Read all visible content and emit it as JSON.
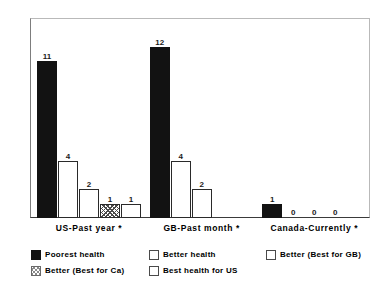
{
  "chart_data": {
    "type": "bar",
    "title": "",
    "subtitle": "",
    "xlabel": "",
    "ylabel": "",
    "ylim": [
      0,
      14
    ],
    "ytick_values": [
      0,
      2,
      4,
      6,
      8,
      10,
      12,
      14
    ],
    "ytick_labels": [
      "0",
      "2",
      "4",
      "6",
      "8",
      "10",
      "12",
      "14"
    ],
    "grid": false,
    "legend_position": "bottom",
    "categories": [
      "US-Past year *",
      "GB-Past month *",
      "Canada-Currently *"
    ],
    "series": [
      {
        "name": "Poorest health",
        "style": "solid",
        "values": [
          11,
          12,
          1
        ],
        "labels": [
          "11",
          "12",
          "1"
        ]
      },
      {
        "name": "Better health",
        "style": "hollow",
        "values": [
          4,
          4,
          0
        ],
        "labels": [
          "4",
          "4",
          "0"
        ]
      },
      {
        "name": "Better (Best for GB)",
        "style": "hollow",
        "values": [
          2,
          2,
          0
        ],
        "labels": [
          "2",
          "2",
          "0"
        ]
      },
      {
        "name": "Better (Best for Ca)",
        "style": "hatch",
        "values": [
          1,
          0,
          0
        ],
        "labels": [
          "1",
          "",
          "0"
        ]
      },
      {
        "name": "Best health for US",
        "style": "hollow",
        "values": [
          1,
          0,
          0
        ],
        "labels": [
          "1",
          "",
          ""
        ]
      }
    ],
    "legend_entries": [
      {
        "label": "Poorest health",
        "style": "solid"
      },
      {
        "label": "Better health",
        "style": "hollow"
      },
      {
        "label": "Better (Best for GB)",
        "style": "hollow"
      },
      {
        "label": "Better (Best for Ca)",
        "style": "hatch"
      },
      {
        "label": "Best health for US",
        "style": "hollow"
      }
    ],
    "colors": {
      "solid": "#121212",
      "hollow_fill": "#ffffff",
      "hollow_edge": "#2a2a2a",
      "hatch": "#4a4a4a",
      "axis": "#3a3a3a",
      "frame": "#b9b9b9",
      "text": "#000000",
      "background": "#ffffff"
    }
  }
}
